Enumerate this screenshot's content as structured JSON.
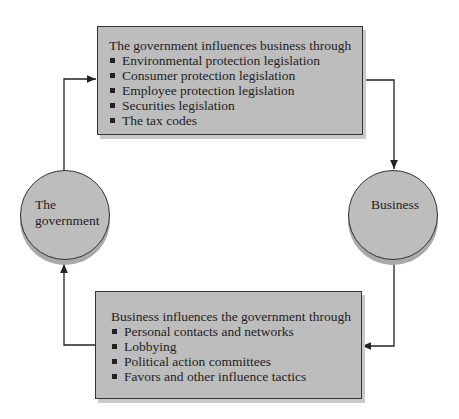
{
  "top_box": {
    "title": "The government influences business through",
    "items": [
      "Environmental protection legislation",
      "Consumer protection legislation",
      "Employee protection legislation",
      "Securities legislation",
      "The tax codes"
    ]
  },
  "bottom_box": {
    "title": "Business influences the government through",
    "items": [
      "Personal contacts and networks",
      "Lobbying",
      "Political action committees",
      "Favors and other influence tactics"
    ]
  },
  "nodes": {
    "government": {
      "line1": "The",
      "line2": "government"
    },
    "business": {
      "label": "Business"
    }
  },
  "colors": {
    "fill": "#bdbdbd",
    "stroke": "#333333"
  }
}
